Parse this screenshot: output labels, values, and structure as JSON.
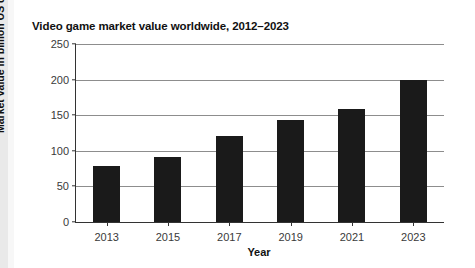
{
  "card": {
    "background_color": "#ffffff",
    "page_background_color": "#ebebeb"
  },
  "chart_data": {
    "type": "bar",
    "title": "Video game market value worldwide, 2012–2023",
    "xlabel": "Year",
    "ylabel": "Market value in billion US dollars",
    "categories": [
      "2013",
      "2015",
      "2017",
      "2019",
      "2021",
      "2023"
    ],
    "values": [
      79,
      91,
      121,
      143,
      159,
      200
    ],
    "ylim": [
      0,
      250
    ],
    "yticks": [
      0,
      50,
      100,
      150,
      200,
      250
    ],
    "ytick_labels": [
      "0",
      "50",
      "100",
      "150",
      "200",
      "250"
    ],
    "grid": true,
    "legend": null,
    "bar_color": "#1a1a1a",
    "gridline_color": "#8d8d8d",
    "axis_color": "#333333"
  }
}
